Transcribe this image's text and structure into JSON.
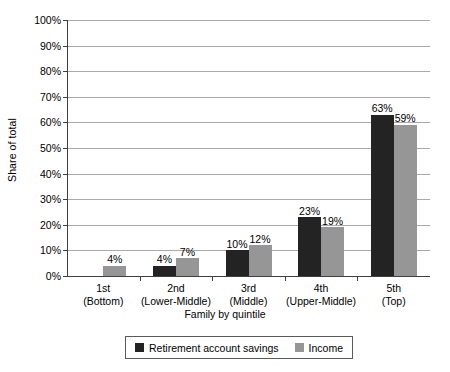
{
  "chart_data": {
    "type": "bar",
    "title": "",
    "xlabel": "Family by quintile",
    "ylabel": "Share of total",
    "categories": [
      "1st\n(Bottom)",
      "2nd\n(Lower-Middle)",
      "3rd\n(Middle)",
      "4th\n(Upper-Middle)",
      "5th\n(Top)"
    ],
    "category_lines": [
      {
        "line1": "1st",
        "line2": "(Bottom)"
      },
      {
        "line1": "2nd",
        "line2": "(Lower-Middle)"
      },
      {
        "line1": "3rd",
        "line2": "(Middle)"
      },
      {
        "line1": "4th",
        "line2": "(Upper-Middle)"
      },
      {
        "line1": "5th",
        "line2": "(Top)"
      }
    ],
    "series": [
      {
        "name": "Retirement account savings",
        "color": "#232323",
        "values": [
          0,
          4,
          10,
          23,
          63
        ],
        "labels": [
          "",
          "4%",
          "10%",
          "23%",
          "63%"
        ]
      },
      {
        "name": "Income",
        "color": "#969696",
        "values": [
          4,
          7,
          12,
          19,
          59
        ],
        "labels": [
          "4%",
          "7%",
          "12%",
          "19%",
          "59%"
        ]
      }
    ],
    "ylim": [
      0,
      100
    ],
    "ytick_labels": [
      "0%",
      "10%",
      "20%",
      "30%",
      "40%",
      "50%",
      "60%",
      "70%",
      "80%",
      "90%",
      "100%"
    ],
    "ytick_values": [
      0,
      10,
      20,
      30,
      40,
      50,
      60,
      70,
      80,
      90,
      100
    ],
    "grid": true,
    "legend_position": "bottom"
  },
  "legend": {
    "items": [
      {
        "label": "Retirement account savings",
        "color": "#232323"
      },
      {
        "label": "Income",
        "color": "#969696"
      }
    ]
  }
}
